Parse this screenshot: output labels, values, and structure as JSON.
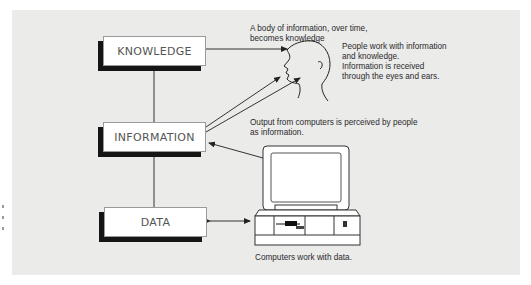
{
  "diagram": {
    "boxes": [
      {
        "id": "knowledge",
        "label": "KNOWLEDGE"
      },
      {
        "id": "information",
        "label": "INFORMATION"
      },
      {
        "id": "data",
        "label": "DATA"
      }
    ],
    "notes": {
      "knowledge_note": "A body of information, over time,\nbecomes knowledge",
      "people_note": "People work with information\nand knowledge.\nInformation is received\nthrough the eyes and ears.",
      "output_note": "Output from computers is perceived by people\nas information.",
      "computer_note": "Computers work with data."
    },
    "icons": [
      "human-head-icon",
      "computer-icon"
    ],
    "colors": {
      "panel": "#ebebea",
      "box": "#ffffff",
      "shadow": "#151515",
      "line": "#333333"
    }
  }
}
